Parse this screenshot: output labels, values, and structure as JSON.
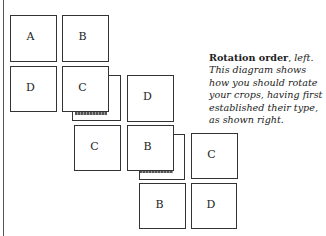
{
  "diagram": {
    "title": "Rotation order",
    "title_suffix": ", ",
    "direction": "left.",
    "caption": " This diagram shows how you should rotate your crops, having first established their type, as shown right.",
    "boxes": {
      "a1": "A",
      "b1": "B",
      "d1": "D",
      "c1": "C",
      "d2": "D",
      "c2": "C",
      "b2": "B",
      "c3": "C",
      "b3": "B",
      "d3": "D"
    }
  }
}
